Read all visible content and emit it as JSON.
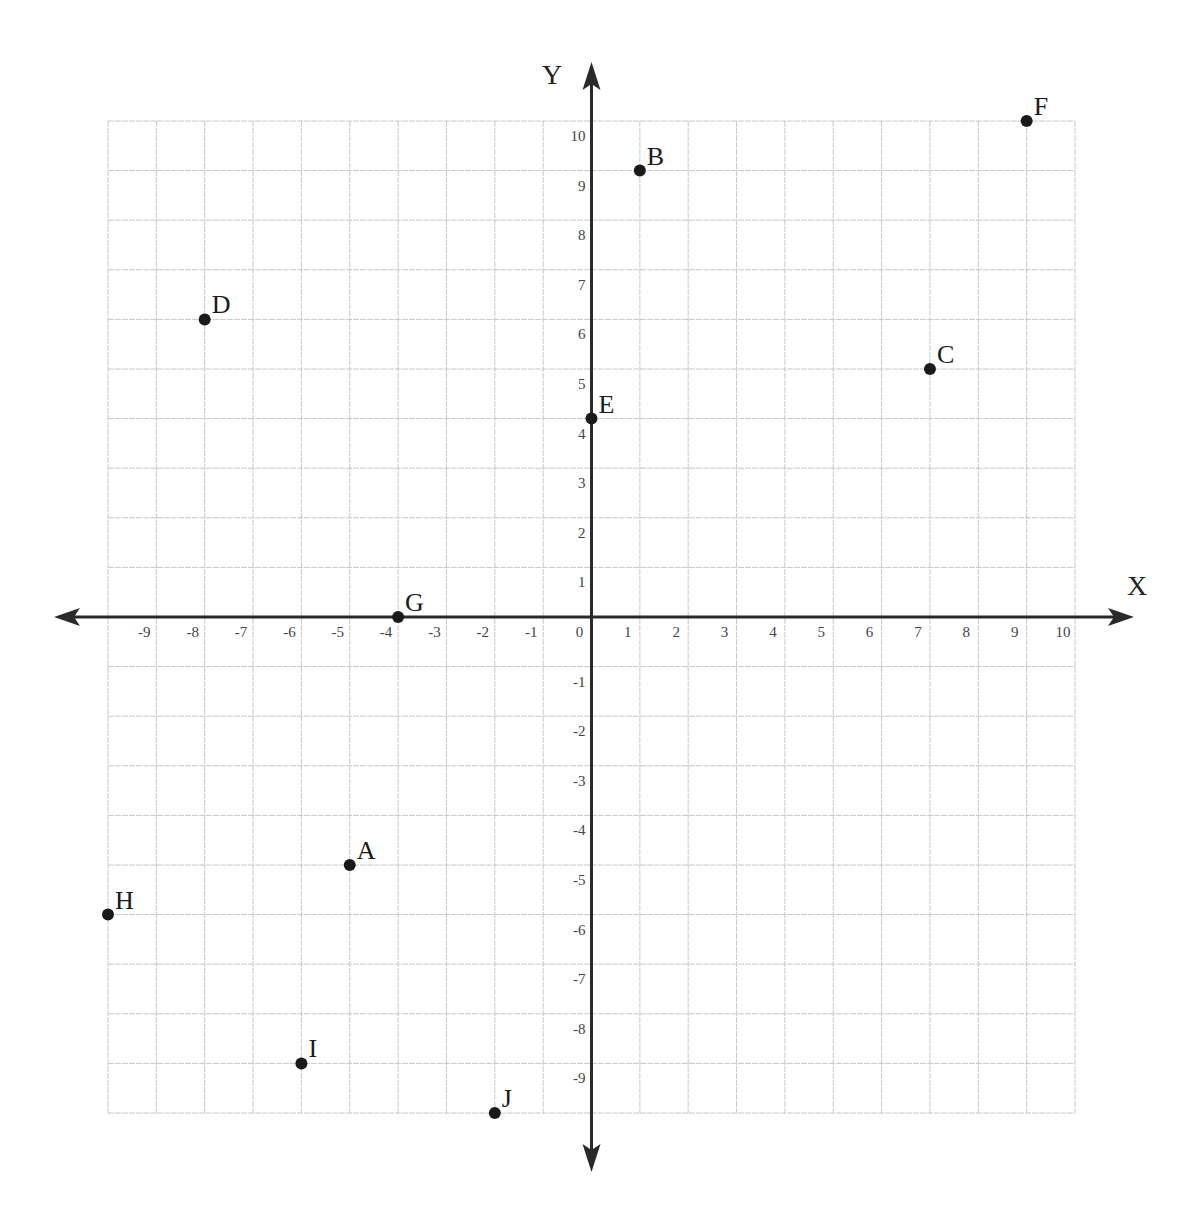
{
  "chart_data": {
    "type": "scatter",
    "title": "",
    "xlabel": "X",
    "ylabel": "Y",
    "xlim": [
      -10,
      10
    ],
    "ylim": [
      -10,
      10
    ],
    "grid": true,
    "legend": null,
    "x_tick_labels": [
      "-9",
      "-8",
      "-7",
      "-6",
      "-5",
      "-4",
      "-3",
      "-2",
      "-1",
      "0",
      "1",
      "2",
      "3",
      "4",
      "5",
      "6",
      "7",
      "8",
      "9",
      "10"
    ],
    "y_tick_labels": [
      "10",
      "9",
      "8",
      "7",
      "6",
      "5",
      "4",
      "3",
      "2",
      "1",
      "-1",
      "-2",
      "-3",
      "-4",
      "-5",
      "-6",
      "-7",
      "-8",
      "-9"
    ],
    "points": [
      {
        "label": "A",
        "x": -5,
        "y": -5
      },
      {
        "label": "B",
        "x": 1,
        "y": 9
      },
      {
        "label": "C",
        "x": 7,
        "y": 5
      },
      {
        "label": "D",
        "x": -8,
        "y": 6
      },
      {
        "label": "E",
        "x": 0,
        "y": 4
      },
      {
        "label": "F",
        "x": 9,
        "y": 10
      },
      {
        "label": "G",
        "x": -4,
        "y": 0
      },
      {
        "label": "H",
        "x": -10,
        "y": -6
      },
      {
        "label": "I",
        "x": -6,
        "y": -9
      },
      {
        "label": "J",
        "x": -2,
        "y": -10
      }
    ]
  },
  "colors": {
    "grid": "#c8c8c8",
    "axis": "#2a2a2a",
    "point": "#1a1a1a",
    "tick_text": "#444444"
  },
  "axes": {
    "x_title": "X",
    "y_title": "Y"
  }
}
